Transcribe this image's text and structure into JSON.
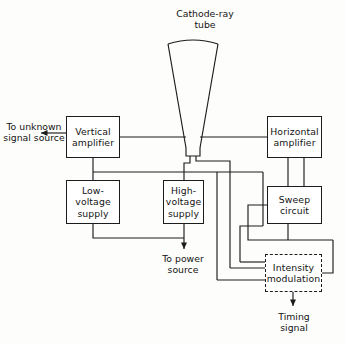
{
  "diagram": {
    "title": "Cathode-ray\ntube",
    "type": "block-diagram",
    "canvas": {
      "width": 345,
      "height": 344
    },
    "colors": {
      "background": "#fdfdfc",
      "stroke": "#1c1c1c",
      "text": "#141414",
      "box_fill": "#ffffff"
    },
    "blocks": [
      {
        "id": "vertical-amplifier",
        "label": "Vertical\namplifier",
        "style": "solid",
        "x": 66,
        "y": 116,
        "w": 54,
        "h": 42
      },
      {
        "id": "horizontal-amplifier",
        "label": "Horizontal\namplifier",
        "style": "solid",
        "x": 267,
        "y": 116,
        "w": 55,
        "h": 42
      },
      {
        "id": "low-voltage-supply",
        "label": "Low-\nvoltage\nsupply",
        "style": "solid",
        "x": 66,
        "y": 180,
        "w": 54,
        "h": 44
      },
      {
        "id": "high-voltage-supply",
        "label": "High-\nvoltage\nsupply",
        "style": "solid",
        "x": 163,
        "y": 180,
        "w": 41,
        "h": 44
      },
      {
        "id": "sweep-circuit",
        "label": "Sweep\ncircuit",
        "style": "solid",
        "x": 267,
        "y": 186,
        "w": 55,
        "h": 38
      },
      {
        "id": "intensity-modulation",
        "label": "Intensity\nmodulation",
        "style": "dashed",
        "x": 265,
        "y": 254,
        "w": 57,
        "h": 38
      }
    ],
    "annotations": [
      {
        "id": "to-unknown-signal-source",
        "text": "To unknown\nsignal source",
        "x": 2,
        "y": 121,
        "w": 64
      },
      {
        "id": "to-power-source",
        "text": "To power\nsource",
        "x": 143,
        "y": 253,
        "w": 80
      },
      {
        "id": "timing-signal",
        "text": "Timing\nsignal",
        "x": 258,
        "y": 311,
        "w": 72
      },
      {
        "id": "cathode-ray-tube-title",
        "text": "Cathode-ray\ntube",
        "x": 160,
        "y": 8,
        "w": 90
      }
    ]
  }
}
